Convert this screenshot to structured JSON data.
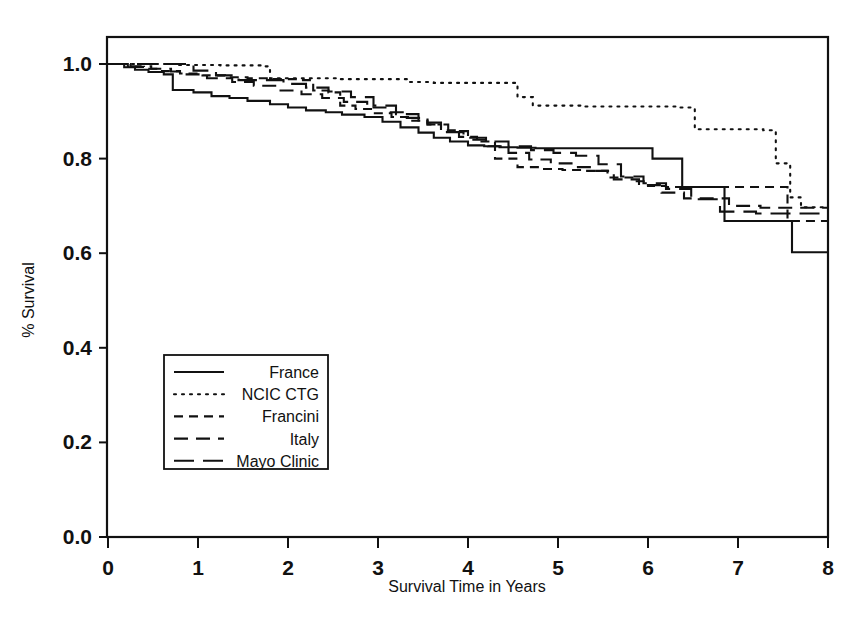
{
  "chart_data": {
    "type": "line",
    "subtype": "kaplan-meier-step",
    "title": "",
    "xlabel": "Survival Time in Years",
    "ylabel": "% Survival",
    "xlim": [
      0,
      8
    ],
    "ylim": [
      0.0,
      1.0
    ],
    "xticks": [
      0,
      1,
      2,
      3,
      4,
      5,
      6,
      7,
      8
    ],
    "xtick_labels": [
      "0",
      "1",
      "2",
      "3",
      "4",
      "5",
      "6",
      "7",
      "8"
    ],
    "yticks": [
      0.0,
      0.2,
      0.4,
      0.6,
      0.8,
      1.0
    ],
    "ytick_labels": [
      "0.0",
      "0.2",
      "0.4",
      "0.6",
      "0.8",
      "1.0"
    ],
    "grid": false,
    "legend_position": "center-left",
    "line_color": "#111111",
    "series": [
      {
        "name": "France",
        "style": "solid",
        "dash": "none",
        "x": [
          0.0,
          0.18,
          0.3,
          0.45,
          0.62,
          0.72,
          0.72,
          0.95,
          1.15,
          1.35,
          1.55,
          1.8,
          2.0,
          2.2,
          2.42,
          2.6,
          2.85,
          3.05,
          3.25,
          3.45,
          3.62,
          3.8,
          4.0,
          4.18,
          4.35,
          4.55,
          4.75,
          5.0,
          5.3,
          6.05,
          6.38,
          6.85,
          7.6,
          8.0
        ],
        "y": [
          1.0,
          0.993,
          0.988,
          0.983,
          0.978,
          0.973,
          0.945,
          0.94,
          0.932,
          0.928,
          0.922,
          0.915,
          0.908,
          0.902,
          0.898,
          0.893,
          0.888,
          0.878,
          0.866,
          0.855,
          0.844,
          0.836,
          0.828,
          0.826,
          0.824,
          0.823,
          0.822,
          0.822,
          0.822,
          0.8,
          0.74,
          0.668,
          0.602,
          0.602
        ]
      },
      {
        "name": "NCIC CTG",
        "style": "dotted",
        "dash": "2 6",
        "x": [
          0.0,
          0.55,
          0.75,
          1.25,
          1.72,
          1.8,
          2.55,
          3.35,
          3.62,
          4.55,
          4.72,
          5.3,
          6.35,
          6.52,
          7.28,
          7.42,
          7.58,
          7.7,
          8.0
        ],
        "y": [
          1.0,
          1.0,
          0.998,
          0.997,
          0.995,
          0.97,
          0.968,
          0.962,
          0.96,
          0.93,
          0.912,
          0.91,
          0.908,
          0.862,
          0.86,
          0.79,
          0.718,
          0.697,
          0.697
        ]
      },
      {
        "name": "Francini",
        "style": "short-dash",
        "dash": "9 6",
        "x": [
          0.0,
          0.22,
          0.4,
          0.6,
          0.8,
          1.05,
          1.3,
          1.55,
          1.78,
          2.1,
          2.28,
          2.45,
          2.58,
          2.75,
          2.95,
          3.15,
          3.35,
          3.55,
          3.7,
          3.9,
          4.1,
          4.3,
          4.55,
          4.8,
          5.05,
          5.3,
          5.55,
          5.85,
          6.0,
          6.2,
          7.28,
          7.55,
          8.0
        ],
        "y": [
          1.0,
          0.994,
          0.99,
          0.985,
          0.98,
          0.976,
          0.972,
          0.97,
          0.968,
          0.966,
          0.944,
          0.94,
          0.912,
          0.905,
          0.896,
          0.888,
          0.88,
          0.872,
          0.86,
          0.846,
          0.836,
          0.8,
          0.782,
          0.778,
          0.776,
          0.774,
          0.76,
          0.752,
          0.742,
          0.74,
          0.74,
          0.668,
          0.668
        ]
      },
      {
        "name": "Italy",
        "style": "medium-dash",
        "dash": "14 8",
        "x": [
          0.0,
          0.25,
          0.48,
          0.7,
          0.85,
          1.1,
          1.38,
          1.62,
          1.9,
          2.15,
          2.38,
          2.62,
          2.88,
          3.1,
          3.32,
          3.55,
          3.78,
          4.0,
          4.22,
          4.45,
          4.68,
          4.92,
          5.15,
          5.4,
          5.62,
          5.9,
          6.15,
          6.4,
          6.9,
          7.25,
          8.0
        ],
        "y": [
          1.0,
          0.995,
          0.99,
          0.984,
          0.978,
          0.97,
          0.962,
          0.954,
          0.944,
          0.936,
          0.928,
          0.92,
          0.908,
          0.898,
          0.886,
          0.872,
          0.858,
          0.84,
          0.826,
          0.812,
          0.798,
          0.79,
          0.782,
          0.774,
          0.756,
          0.744,
          0.728,
          0.716,
          0.7,
          0.696,
          0.696
        ]
      },
      {
        "name": "Mayo Clinic",
        "style": "long-dash",
        "dash": "20 9",
        "x": [
          0.0,
          0.35,
          0.72,
          0.95,
          1.2,
          1.45,
          1.7,
          1.95,
          2.2,
          2.45,
          2.7,
          2.95,
          3.2,
          3.45,
          3.7,
          3.95,
          4.2,
          4.45,
          4.7,
          4.95,
          5.2,
          5.45,
          5.7,
          5.95,
          6.2,
          6.48,
          6.8,
          7.2,
          8.0
        ],
        "y": [
          1.0,
          1.0,
          1.0,
          0.986,
          0.976,
          0.966,
          0.966,
          0.958,
          0.95,
          0.942,
          0.93,
          0.912,
          0.894,
          0.876,
          0.856,
          0.844,
          0.836,
          0.826,
          0.818,
          0.812,
          0.806,
          0.788,
          0.762,
          0.748,
          0.736,
          0.714,
          0.688,
          0.684,
          0.684
        ]
      }
    ]
  },
  "legend": {
    "entries": [
      {
        "label": "France",
        "style": "solid"
      },
      {
        "label": "NCIC CTG",
        "style": "dotted"
      },
      {
        "label": "Francini",
        "style": "short-dash"
      },
      {
        "label": "Italy",
        "style": "medium-dash"
      },
      {
        "label": "Mayo Clinic",
        "style": "long-dash"
      }
    ]
  }
}
